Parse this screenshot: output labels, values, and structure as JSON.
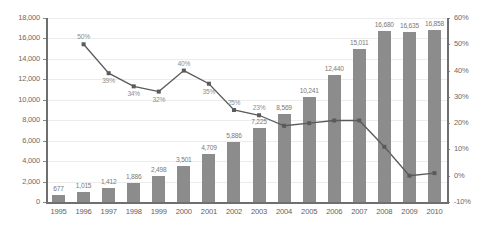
{
  "chart_data": {
    "type": "bar",
    "title": "",
    "subtitle": "",
    "xlabel": "",
    "ylabel": "",
    "grid": true,
    "legend_position": "none",
    "categories": [
      "1995",
      "1996",
      "1997",
      "1998",
      "1999",
      "2000",
      "2001",
      "2002",
      "2003",
      "2004",
      "2005",
      "2006",
      "2007",
      "2008",
      "2009",
      "2010"
    ],
    "series": [
      {
        "name": "Total",
        "type": "bar",
        "axis": "left",
        "color": "#8c8c8c",
        "values": [
          677,
          1015,
          1412,
          1886,
          2498,
          3501,
          4709,
          5886,
          7225,
          8569,
          10241,
          12440,
          15011,
          16680,
          16635,
          16858
        ],
        "labels": [
          "677",
          "1,015",
          "1,412",
          "1,886",
          "2,498",
          "3,501",
          "4,709",
          "5,886",
          "7,225",
          "8,569",
          "10,241",
          "12,440",
          "15,011",
          "16,680",
          "16,635",
          "16,858"
        ]
      },
      {
        "name": "Growth",
        "type": "line",
        "axis": "right",
        "color": "#5a5a5a",
        "values": [
          null,
          50,
          39,
          34,
          32,
          40,
          35,
          25,
          23,
          19,
          20,
          21,
          21,
          11,
          0,
          1
        ],
        "labels": [
          "",
          "50%",
          "39%",
          "34%",
          "32%",
          "40%",
          "35%",
          "25%",
          "23%",
          "19%",
          "20%",
          "21%",
          "21%",
          "11%",
          "0%",
          "1%"
        ]
      }
    ],
    "left_axis": {
      "min": 0,
      "max": 18000,
      "step": 2000,
      "ticks": [
        "0",
        "2,000",
        "4,000",
        "6,000",
        "8,000",
        "10,000",
        "12,000",
        "14,000",
        "16,000",
        "18,000"
      ]
    },
    "right_axis": {
      "min": -10,
      "max": 60,
      "step": 10,
      "ticks": [
        "-10%",
        "0%",
        "10%",
        "20%",
        "30%",
        "40%",
        "50%",
        "60%"
      ]
    },
    "colors": {
      "bar": "#8c8c8c",
      "line": "#5a5a5a",
      "grid": "#ececec",
      "axis": "#6f6f6f",
      "label_text": "#7a7a7a",
      "tick_text": "#6b6b6b",
      "background": "#ffffff"
    }
  }
}
